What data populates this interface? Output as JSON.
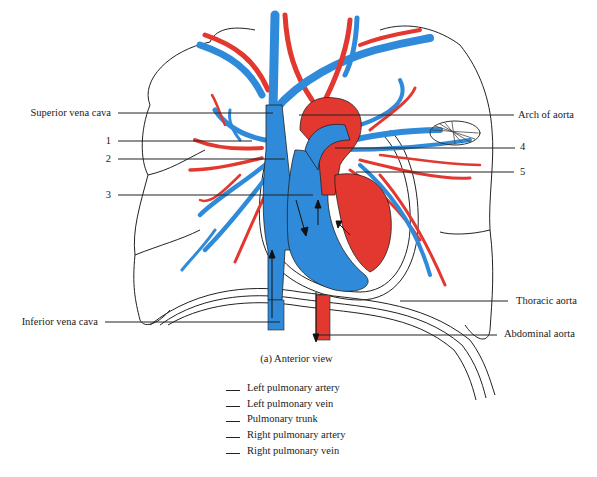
{
  "figure": {
    "caption": "(a) Anterior view",
    "colors": {
      "deoxygenated": "#2f8bd9",
      "oxygenated": "#e2382f",
      "outline": "#222222",
      "leader": "#222222"
    }
  },
  "labels": {
    "left": [
      {
        "id": "superior-vena-cava",
        "text": "Superior vena cava",
        "y": 113
      },
      {
        "id": "label-1",
        "text": "1",
        "y": 141
      },
      {
        "id": "label-2",
        "text": "2",
        "y": 159
      },
      {
        "id": "label-3",
        "text": "3",
        "y": 195
      },
      {
        "id": "inferior-vena-cava",
        "text": "Inferior vena cava",
        "y": 322
      }
    ],
    "right": [
      {
        "id": "arch-of-aorta",
        "text": "Arch of aorta",
        "y": 115
      },
      {
        "id": "label-4",
        "text": "4",
        "y": 147
      },
      {
        "id": "label-5",
        "text": "5",
        "y": 172
      },
      {
        "id": "thoracic-aorta",
        "text": "Thoracic aorta",
        "y": 301
      },
      {
        "id": "abdominal-aorta",
        "text": "Abdominal aorta",
        "y": 334
      }
    ]
  },
  "answer_key": {
    "items": [
      "Left pulmonary artery",
      "Left pulmonary vein",
      "Pulmonary trunk",
      "Right pulmonary artery",
      "Right pulmonary vein"
    ]
  }
}
